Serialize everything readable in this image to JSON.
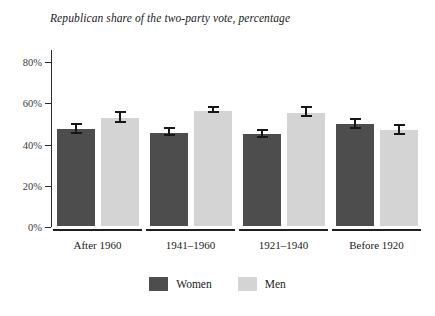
{
  "chart_data": {
    "type": "bar",
    "title": "Republican share of the two-party vote, percentage",
    "xlabel": "",
    "ylabel": "",
    "ylim": [
      0,
      85
    ],
    "grid": false,
    "legend_position": "bottom-center",
    "categories": [
      "After 1960",
      "1941–1960",
      "1921–1940",
      "Before 1920"
    ],
    "series": [
      {
        "name": "Women",
        "color": "#4d4d4d",
        "values": [
          48.0,
          46.3,
          45.5,
          50.3
        ],
        "errors": [
          2.6,
          2.2,
          2.3,
          2.8
        ]
      },
      {
        "name": "Men",
        "color": "#d4d4d4",
        "values": [
          53.5,
          57.0,
          56.0,
          47.5
        ],
        "errors": [
          2.8,
          1.8,
          2.6,
          2.6
        ]
      }
    ],
    "yticks": [
      0,
      20,
      40,
      60,
      80
    ],
    "ytick_labels": [
      "0%",
      "20%",
      "40%",
      "60%",
      "80%"
    ]
  },
  "legend": {
    "items": [
      {
        "label": "Women",
        "swatch": "women-swatch"
      },
      {
        "label": "Men",
        "swatch": "men-swatch"
      }
    ]
  },
  "colors": {
    "women": "#4d4d4d",
    "men": "#d4d4d4",
    "axis": "#2b2b2b",
    "error_bar": "#171717",
    "background": "#ffffff"
  }
}
